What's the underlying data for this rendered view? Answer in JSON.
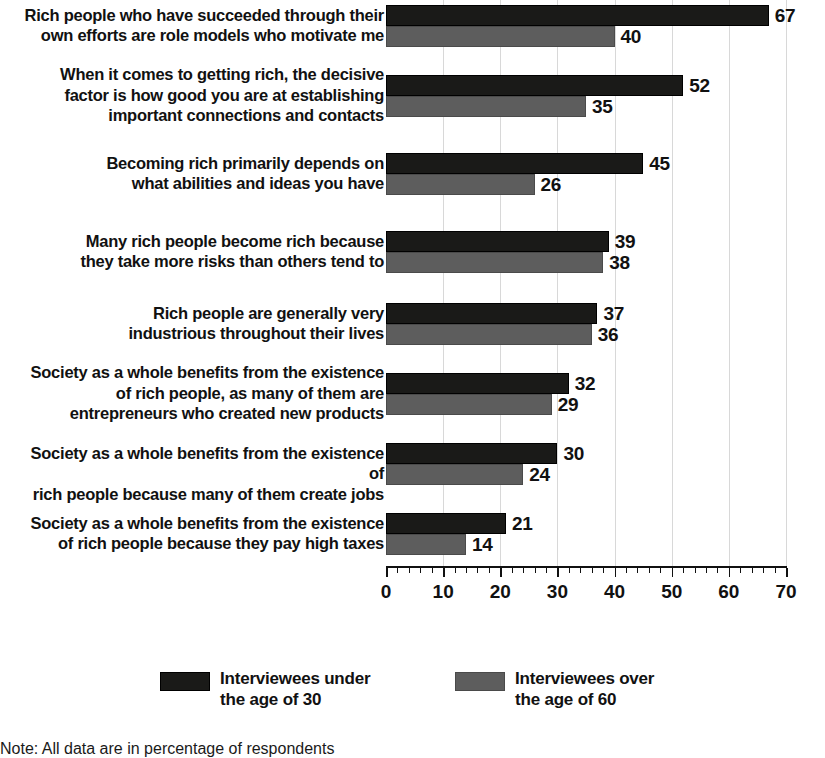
{
  "chart_data": {
    "type": "bar",
    "orientation": "horizontal",
    "title": "",
    "subtitle": "",
    "xlabel": "",
    "ylabel": "",
    "xlim": [
      0,
      70
    ],
    "xticks": [
      0,
      10,
      20,
      30,
      40,
      50,
      60,
      70
    ],
    "xtick_labels": [
      "0",
      "10",
      "20",
      "30",
      "40",
      "50",
      "60",
      "70"
    ],
    "minor_tick_step": 2,
    "grid": "vertical-light",
    "legend_position": "bottom",
    "value_labels": true,
    "categories": [
      "Rich people who have succeeded through their own efforts are role models who motivate me",
      "When it comes to getting rich, the decisive factor is how good you are at establishing important connections and contacts",
      "Becoming rich primarily depends on what abilities and ideas you have",
      "Many rich people become rich because they take more risks than others tend to",
      "Rich people are generally very industrious throughout their lives",
      "Society as a whole benefits from the existence of rich people, as many of them are entrepreneurs who created new products",
      "Society as a whole benefits from the existence of rich people because many of them create jobs",
      "Society as a whole benefits from the existence of rich people because they pay high taxes"
    ],
    "category_lines": [
      [
        "Rich people who have succeeded through their",
        "own efforts are role models who motivate me"
      ],
      [
        "When it comes to getting rich, the decisive",
        "factor is how good you are at establishing",
        "important connections and contacts"
      ],
      [
        "Becoming rich primarily depends on",
        "what abilities and ideas you have"
      ],
      [
        "Many rich people become rich because",
        "they take more risks than others tend to"
      ],
      [
        "Rich people are generally very",
        "industrious throughout their lives"
      ],
      [
        "Society as a whole benefits from the existence",
        "of rich people, as many of them are",
        "entrepreneurs who created new products"
      ],
      [
        "Society as a whole benefits from the existence of",
        "rich people because many of them create jobs"
      ],
      [
        "Society as a whole benefits from the existence",
        "of rich people because they pay high taxes"
      ]
    ],
    "series": [
      {
        "name": "Interviewees under the age of 30",
        "color": "#1a1a18",
        "values": [
          67,
          52,
          45,
          39,
          37,
          32,
          30,
          21
        ]
      },
      {
        "name": "Interviewees over the age of 60",
        "color": "#5d5d5d",
        "values": [
          40,
          35,
          26,
          38,
          36,
          29,
          24,
          14
        ]
      }
    ]
  },
  "legend": {
    "items": [
      {
        "label": "Interviewees under\nthe age of 30",
        "color": "#1a1a18",
        "swatch_name": "legend-swatch-under-30"
      },
      {
        "label": "Interviewees over\nthe age of 60",
        "color": "#5d5d5d",
        "swatch_name": "legend-swatch-over-60"
      }
    ]
  },
  "note": "Note: All data are in percentage of respondents",
  "colors": {
    "series_dark": "#1a1a18",
    "series_gray": "#5d5d5d",
    "axis": "#111111",
    "gridline": "#d8d8d8",
    "text": "#111111",
    "background": "#ffffff"
  }
}
